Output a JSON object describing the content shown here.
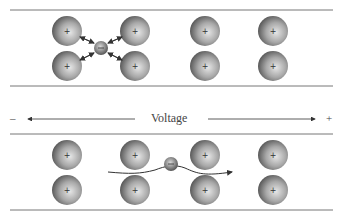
{
  "diagram": {
    "voltage_label": "Voltage",
    "minus_label": "–",
    "plus_label": "+",
    "ion_charge_symbol": "+",
    "top_panel": {
      "ions": [
        {
          "x": 67,
          "y": 31
        },
        {
          "x": 67,
          "y": 66
        },
        {
          "x": 135,
          "y": 31
        },
        {
          "x": 135,
          "y": 66
        },
        {
          "x": 205,
          "y": 31
        },
        {
          "x": 205,
          "y": 66
        },
        {
          "x": 273,
          "y": 31
        },
        {
          "x": 273,
          "y": 66
        }
      ],
      "electron": {
        "x": 101,
        "y": 48
      }
    },
    "bottom_panel": {
      "ions": [
        {
          "x": 67,
          "y": 155
        },
        {
          "x": 67,
          "y": 190
        },
        {
          "x": 135,
          "y": 155
        },
        {
          "x": 135,
          "y": 190
        },
        {
          "x": 205,
          "y": 155
        },
        {
          "x": 205,
          "y": 190
        },
        {
          "x": 273,
          "y": 155
        },
        {
          "x": 273,
          "y": 190
        }
      ],
      "electron": {
        "x": 171,
        "y": 164
      }
    }
  }
}
